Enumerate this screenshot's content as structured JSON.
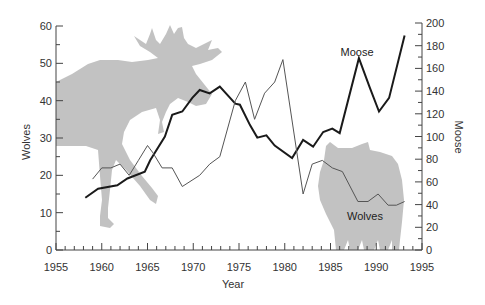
{
  "chart_data": {
    "type": "line",
    "title": "",
    "xlabel": "Year",
    "ylabel_left": "Wolves",
    "ylabel_right": "Moose",
    "xlim": [
      1955,
      1995
    ],
    "xticks": [
      1955,
      1960,
      1965,
      1970,
      1975,
      1980,
      1985,
      1990,
      1995
    ],
    "ylim_left": [
      0,
      60
    ],
    "yticks_left": [
      0,
      10,
      20,
      30,
      40,
      50,
      60
    ],
    "ylim_right": [
      0,
      200
    ],
    "yticks_right": [
      0,
      20,
      40,
      60,
      80,
      100,
      120,
      140,
      160,
      180,
      200
    ],
    "grid": false,
    "legend": "none (inline labels)",
    "series": [
      {
        "name": "Moose",
        "axis": "right",
        "style": "thick dark line",
        "label": "Moose",
        "color": "#1a1a1a",
        "x": [
          1958.2,
          1959.6,
          1961.7,
          1962.8,
          1964.7,
          1965.3,
          1966.9,
          1967.7,
          1968.8,
          1969.9,
          1970.7,
          1971.8,
          1972.9,
          1974.6,
          1975.1,
          1976.2,
          1977.0,
          1978.0,
          1978.9,
          1980.8,
          1982.0,
          1983.1,
          1984.2,
          1985.2,
          1986.0,
          1988.1,
          1989.3,
          1990.3,
          1991.4,
          1993.1
        ],
        "values": [
          46,
          54,
          57,
          63,
          69,
          79,
          100,
          119,
          122,
          134,
          141,
          138,
          144,
          129,
          128,
          110,
          99,
          101,
          92,
          81,
          97,
          91,
          104,
          107,
          103,
          169,
          143,
          122,
          134,
          189
        ]
      },
      {
        "name": "Wolves",
        "axis": "left",
        "style": "thin gray line",
        "label": "Wolves",
        "color": "#555555",
        "x": [
          1959.0,
          1960.0,
          1961.0,
          1962.0,
          1963.0,
          1964.0,
          1965.0,
          1965.6,
          1966.6,
          1967.7,
          1968.8,
          1970.7,
          1971.8,
          1972.9,
          1974.6,
          1975.7,
          1976.7,
          1977.8,
          1978.9,
          1979.8,
          1982.0,
          1983.0,
          1984.1,
          1985.2,
          1986.3,
          1988.0,
          1989.1,
          1990.2,
          1991.3,
          1992.2,
          1993.1
        ],
        "values": [
          19,
          22,
          22,
          23,
          20,
          24,
          28,
          26,
          22,
          22,
          17,
          20,
          23,
          25,
          40,
          45,
          35,
          42,
          45,
          51,
          15,
          23,
          24,
          22,
          21,
          13,
          13,
          15,
          12,
          12,
          13
        ]
      }
    ],
    "decorations": [
      {
        "name": "moose-silhouette",
        "color": "#c2c2c2"
      },
      {
        "name": "wolf-silhouette",
        "color": "#c2c2c2"
      }
    ]
  }
}
